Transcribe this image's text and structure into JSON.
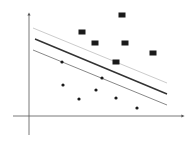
{
  "diagram": {
    "type": "svm-margin",
    "axes": {
      "y_axis": {
        "x": 29,
        "y1": 135,
        "y2": 14
      },
      "x_axis": {
        "y": 116,
        "x1": 13,
        "x2": 183
      },
      "color": "#555555"
    },
    "lines": [
      {
        "name": "upper-margin",
        "x1": 33,
        "y1": 28,
        "x2": 167,
        "y2": 83,
        "color": "#cccccc",
        "width": 1
      },
      {
        "name": "decision-boundary",
        "x1": 35,
        "y1": 39,
        "x2": 167,
        "y2": 94,
        "color": "#333333",
        "width": 1.4
      },
      {
        "name": "lower-margin",
        "x1": 33,
        "y1": 50,
        "x2": 167,
        "y2": 105,
        "color": "#888888",
        "width": 1
      }
    ],
    "squares": [
      {
        "x": 122,
        "y": 15
      },
      {
        "x": 82,
        "y": 32
      },
      {
        "x": 95,
        "y": 43
      },
      {
        "x": 125,
        "y": 43
      },
      {
        "x": 153,
        "y": 53
      },
      {
        "x": 116,
        "y": 62
      }
    ],
    "dots": [
      {
        "x": 62,
        "y": 62
      },
      {
        "x": 102,
        "y": 78
      },
      {
        "x": 63,
        "y": 85
      },
      {
        "x": 96,
        "y": 90
      },
      {
        "x": 79,
        "y": 99
      },
      {
        "x": 116,
        "y": 98
      },
      {
        "x": 137,
        "y": 108
      }
    ],
    "point_color": "#1a1a1a"
  }
}
